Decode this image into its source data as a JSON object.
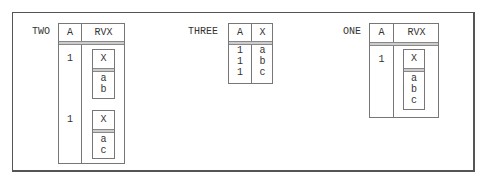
{
  "relations": {
    "two": {
      "name": "TWO",
      "headers": [
        "A",
        "RVX"
      ],
      "rows": [
        {
          "a": "1",
          "rvx": {
            "header": "X",
            "values": [
              "a",
              "b"
            ]
          }
        },
        {
          "a": "1",
          "rvx": {
            "header": "X",
            "values": [
              "a",
              "c"
            ]
          }
        }
      ]
    },
    "three": {
      "name": "THREE",
      "headers": [
        "A",
        "X"
      ],
      "rows": [
        {
          "a": "1",
          "x": "a"
        },
        {
          "a": "1",
          "x": "b"
        },
        {
          "a": "1",
          "x": "c"
        }
      ]
    },
    "one": {
      "name": "ONE",
      "headers": [
        "A",
        "RVX"
      ],
      "rows": [
        {
          "a": "1",
          "rvx": {
            "header": "X",
            "values": [
              "a",
              "b",
              "c"
            ]
          }
        }
      ]
    }
  }
}
